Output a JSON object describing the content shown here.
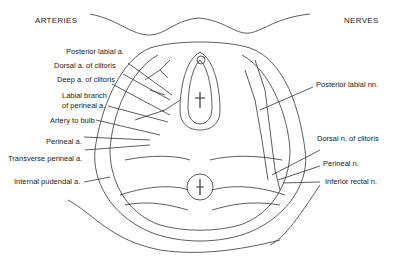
{
  "headers": {
    "left": "ARTERIES",
    "right": "NERVES"
  },
  "arteries": [
    {
      "label": "Posterior labial a."
    },
    {
      "label": "Dorsal a. of clitoris"
    },
    {
      "label": "Deep a. of clitoris"
    },
    {
      "label": "Labial branch"
    },
    {
      "label": "of perineal a."
    },
    {
      "label": "Artery to bulb"
    },
    {
      "label": "Perineal a."
    },
    {
      "label": "Transverse perineal a."
    },
    {
      "label": "Internal pudendal a."
    }
  ],
  "nerves": [
    {
      "label": "Posterior labial nn."
    },
    {
      "label": "Dorsal n. of clitoris"
    },
    {
      "label": "Perineal n."
    },
    {
      "label": "Inferior rectal n."
    }
  ],
  "colors": {
    "ink": "#222222",
    "background": "#ffffff"
  }
}
